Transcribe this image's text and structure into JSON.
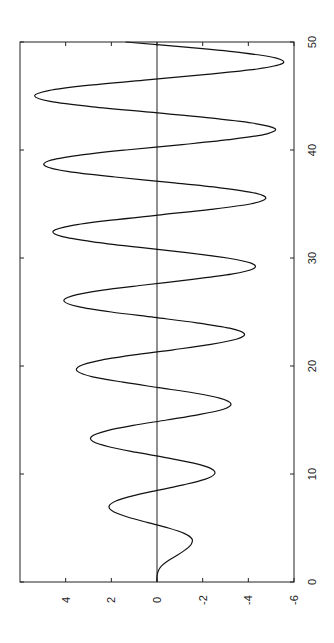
{
  "chart_data": {
    "type": "line",
    "orientation": "rotated-90-ccw",
    "title": "",
    "xlabel": "",
    "ylabel": "",
    "xlim": [
      0,
      50
    ],
    "ylim": [
      -6,
      6
    ],
    "x_ticks": [
      0,
      10,
      20,
      30,
      40,
      50
    ],
    "y_ticks": [
      4,
      2,
      0,
      -2,
      -4,
      -6
    ],
    "x_tick_labels": [
      "0",
      "10",
      "20",
      "30",
      "40",
      "50"
    ],
    "y_tick_labels": [
      "4",
      "2",
      "0",
      "-2",
      "-4",
      "-6"
    ],
    "grid": false,
    "zero_line": true,
    "legend": null,
    "series": [
      {
        "name": "signal",
        "color": "#111111",
        "x_step": 0.5,
        "x_start": 0,
        "values": [
          0,
          0,
          -0.05,
          -0.2,
          -0.5,
          -0.9,
          -1.25,
          -1.5,
          -1.53,
          -1.19,
          -0.5,
          0.39,
          1.26,
          1.9,
          2.1,
          1.8,
          1.02,
          -0.05,
          -1.16,
          -2.09,
          -2.52,
          -2.37,
          -1.61,
          -0.44,
          0.88,
          2.07,
          2.8,
          2.85,
          2.21,
          1.04,
          -0.42,
          -1.84,
          -2.91,
          -3.24,
          -2.78,
          -1.63,
          -0.06,
          1.49,
          2.82,
          3.48,
          3.38,
          2.55,
          1.09,
          -0.71,
          -2.36,
          -3.51,
          -3.82,
          -3.18,
          -1.74,
          0.11,
          2.0,
          3.45,
          4.07,
          3.71,
          2.45,
          0.56,
          -1.46,
          -3.26,
          -4.22,
          -4.15,
          -3.08,
          -1.3,
          0.85,
          2.8,
          4.18,
          4.54,
          3.75,
          2.01,
          -0.17,
          -2.36,
          -4.08,
          -4.76,
          -4.31,
          -2.76,
          -0.54,
          1.83,
          3.86,
          4.88,
          4.73,
          3.45,
          1.36,
          -1.11,
          -3.33,
          -4.82,
          -5.16,
          -4.17,
          -2.18,
          0.33,
          2.82,
          4.68,
          5.36,
          4.75,
          2.95,
          0.43,
          -2.19,
          -4.4,
          -5.49,
          -5.23,
          -3.76,
          -1.38,
          1.38
        ]
      }
    ]
  }
}
